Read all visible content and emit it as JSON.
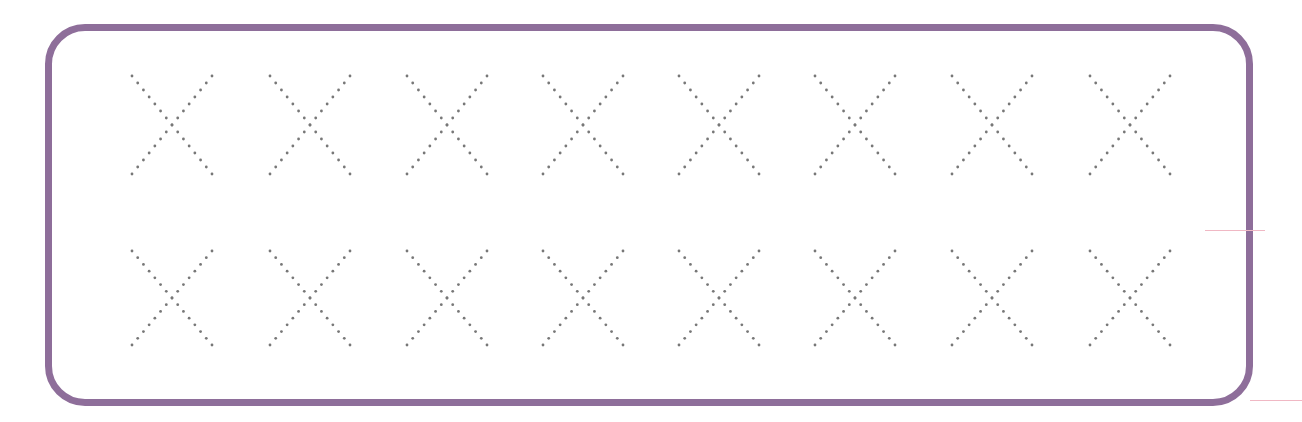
{
  "worksheet": {
    "title": "Letter X tracing practice",
    "frame_color": "#8e6e9a",
    "dot_color": "#777777",
    "letter": "X",
    "rows": [
      {
        "y_top": 76,
        "y_bottom": 174,
        "centers": [
          172,
          310,
          447,
          583,
          719,
          855,
          992,
          1130
        ]
      },
      {
        "y_top": 251,
        "y_bottom": 345,
        "centers": [
          172,
          310,
          447,
          583,
          719,
          855,
          992,
          1130
        ]
      }
    ],
    "letter_half_width": 40
  }
}
